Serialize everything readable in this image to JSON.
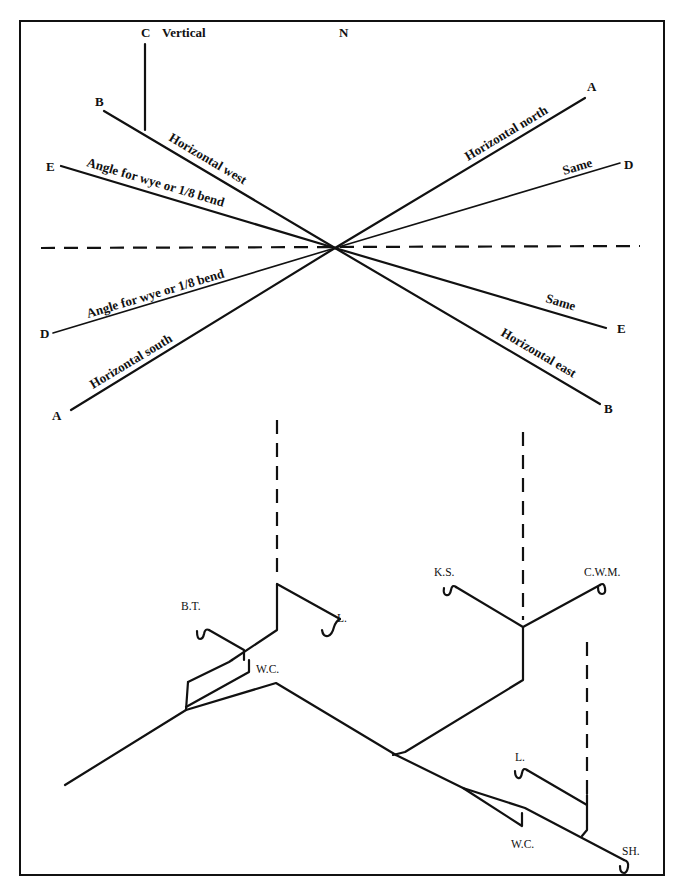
{
  "compass": {
    "north_label": "N",
    "vertical": {
      "point": "C",
      "label": "Vertical"
    },
    "lines": [
      {
        "id": "horizontal-west",
        "label": "Horizontal west",
        "end_point": "B"
      },
      {
        "id": "angle-west",
        "label": "Angle for wye or 1/8 bend",
        "end_point": "E"
      },
      {
        "id": "horizontal-north",
        "label": "Horizontal north",
        "end_point": "A"
      },
      {
        "id": "same-north",
        "label": "Same",
        "end_point": "D"
      },
      {
        "id": "angle-south",
        "label": "Angle for wye or 1/8 bend",
        "end_point": "D"
      },
      {
        "id": "horizontal-south",
        "label": "Horizontal south",
        "end_point": "A"
      },
      {
        "id": "same-east",
        "label": "Same",
        "end_point": "E"
      },
      {
        "id": "horizontal-east",
        "label": "Horizontal east",
        "end_point": "B"
      }
    ]
  },
  "isometric": {
    "fixtures": [
      {
        "id": "bath-tub",
        "label": "B.T."
      },
      {
        "id": "lavatory-upper",
        "label": "L."
      },
      {
        "id": "water-closet-left",
        "label": "W.C."
      },
      {
        "id": "kitchen-sink",
        "label": "K.S."
      },
      {
        "id": "clothes-washing-machine",
        "label": "C.W.M."
      },
      {
        "id": "lavatory-lower",
        "label": "L."
      },
      {
        "id": "water-closet-right",
        "label": "W.C."
      },
      {
        "id": "shower",
        "label": "SH."
      }
    ]
  }
}
